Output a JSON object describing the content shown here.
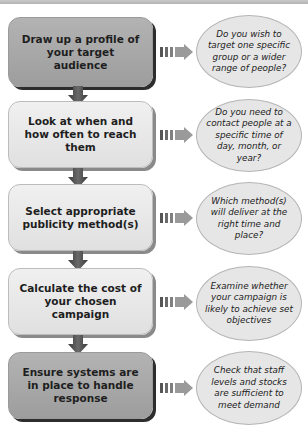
{
  "diagram": {
    "type": "flowchart",
    "steps": [
      {
        "label": "Draw up a profile of your target audience",
        "style": "dark",
        "question": "Do you wish to target one specific group or a wider range of people?"
      },
      {
        "label": "Look at when and how often to reach them",
        "style": "light",
        "question": "Do you need to contact people at a specific time of day, month, or year?"
      },
      {
        "label": "Select appropriate publicity method(s)",
        "style": "light",
        "question": "Which method(s) will deliver at the right time and place?"
      },
      {
        "label": "Calculate the cost of your chosen campaign",
        "style": "light",
        "question": "Examine whether your campaign is likely to achieve set objectives"
      },
      {
        "label": "Ensure systems are in place to handle response",
        "style": "dark",
        "question": "Check that staff levels and stocks are sufficient to meet demand"
      }
    ],
    "icons": {
      "down_arrow": "arrow-down-icon",
      "right_arrow": "striped-arrow-right-icon"
    },
    "colors": {
      "dark_box": "#a8a8a8",
      "light_box": "#e8e8e8",
      "bubble": "#e6e6e6",
      "arrow": "#555555",
      "text": "#1e1e1e"
    }
  }
}
